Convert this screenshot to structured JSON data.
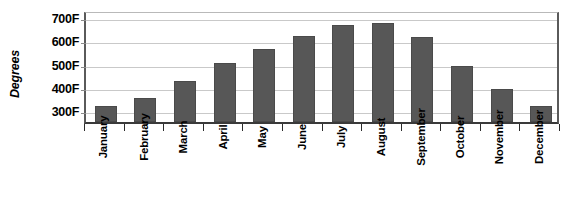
{
  "chart_data": {
    "type": "bar",
    "title": "",
    "xlabel": "",
    "ylabel": "Degrees",
    "categories": [
      "January",
      "February",
      "March",
      "April",
      "May",
      "June",
      "July",
      "August",
      "September",
      "October",
      "November",
      "December"
    ],
    "values": [
      320,
      355,
      425,
      505,
      565,
      620,
      665,
      675,
      615,
      490,
      390,
      320
    ],
    "tick_labels": [
      "300F",
      "400F",
      "500F",
      "600F",
      "700F"
    ],
    "tick_values": [
      300,
      400,
      500,
      600,
      700
    ],
    "ylim": [
      250,
      730
    ],
    "grid": true,
    "legend": "none",
    "series_color": "#575757",
    "gridline_color": "#c9c9c9",
    "axis_color": "#3a3a3a"
  }
}
